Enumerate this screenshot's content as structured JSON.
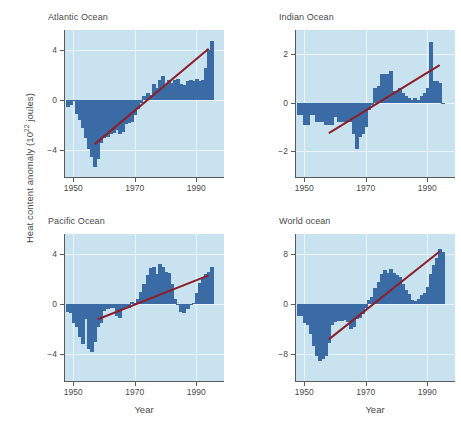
{
  "figure": {
    "ylabel_prefix": "Heat content anomaly (10",
    "ylabel_sup": "22",
    "ylabel_suffix": " joules)",
    "xlabel": "Year",
    "colors": {
      "bar": "#3a6ba5",
      "panel_background": "#c9e2f0",
      "gridline": "#eaf4fa",
      "trend_line": "#8b1f2a",
      "axis": "#5a5a5a",
      "text": "#4a4a4a",
      "page_background": "#ffffff"
    }
  },
  "chart_data": [
    {
      "type": "bar",
      "title": "Atlantic Ocean",
      "xlabel": "Year",
      "ylabel": "Heat content anomaly (10^22 joules)",
      "xlim": [
        1947,
        1999
      ],
      "ylim": [
        -6.2,
        5.6
      ],
      "xticks": [
        1950,
        1970,
        1990
      ],
      "yticks": [
        -4,
        0,
        4
      ],
      "grid": true,
      "trend_line": {
        "x": [
          1957,
          1994
        ],
        "y": [
          -3.5,
          4.1
        ]
      },
      "x": [
        1948,
        1949,
        1950,
        1951,
        1952,
        1953,
        1954,
        1955,
        1956,
        1957,
        1958,
        1959,
        1960,
        1961,
        1962,
        1963,
        1964,
        1965,
        1966,
        1967,
        1968,
        1969,
        1970,
        1971,
        1972,
        1973,
        1974,
        1975,
        1976,
        1977,
        1978,
        1979,
        1980,
        1981,
        1982,
        1983,
        1984,
        1985,
        1986,
        1987,
        1988,
        1989,
        1990,
        1991,
        1992,
        1993,
        1994,
        1995
      ],
      "values": [
        -0.5,
        -0.4,
        0.0,
        -1.1,
        -1.6,
        -2.2,
        -3.0,
        -3.9,
        -4.5,
        -5.3,
        -4.7,
        -3.4,
        -3.0,
        -2.9,
        -2.7,
        -2.6,
        -2.4,
        -2.7,
        -2.5,
        -1.9,
        -1.8,
        -1.7,
        -1.2,
        -0.7,
        -0.2,
        0.3,
        0.6,
        0.4,
        1.3,
        1.0,
        1.6,
        1.9,
        1.3,
        1.6,
        1.4,
        1.6,
        1.7,
        1.3,
        1.2,
        1.5,
        1.6,
        1.5,
        1.7,
        1.5,
        1.6,
        2.6,
        4.0,
        4.7
      ]
    },
    {
      "type": "bar",
      "title": "Indian Ocean",
      "xlabel": "Year",
      "ylabel": "Heat content anomaly (10^22 joules)",
      "xlim": [
        1947,
        1999
      ],
      "ylim": [
        -3.1,
        3.0
      ],
      "xticks": [
        1950,
        1970,
        1990
      ],
      "yticks": [
        -2,
        0,
        2
      ],
      "grid": true,
      "trend_line": {
        "x": [
          1958,
          1994
        ],
        "y": [
          -1.25,
          1.55
        ]
      },
      "x": [
        1948,
        1949,
        1950,
        1951,
        1952,
        1953,
        1954,
        1955,
        1956,
        1957,
        1958,
        1959,
        1960,
        1961,
        1962,
        1963,
        1964,
        1965,
        1966,
        1967,
        1968,
        1969,
        1970,
        1971,
        1972,
        1973,
        1974,
        1975,
        1976,
        1977,
        1978,
        1979,
        1980,
        1981,
        1982,
        1983,
        1984,
        1985,
        1986,
        1987,
        1988,
        1989,
        1990,
        1991,
        1992,
        1993,
        1994,
        1995
      ],
      "values": [
        -0.5,
        -0.5,
        -0.9,
        -0.9,
        -0.5,
        -0.5,
        -0.8,
        -0.8,
        -0.8,
        -0.9,
        -0.9,
        -0.9,
        -0.6,
        -0.8,
        -0.8,
        -0.8,
        -0.8,
        -0.8,
        -1.3,
        -1.9,
        -1.4,
        -1.3,
        -1.0,
        -0.3,
        -0.1,
        0.6,
        0.7,
        1.2,
        1.2,
        1.2,
        1.3,
        0.5,
        0.5,
        0.6,
        0.4,
        0.3,
        0.2,
        0.1,
        0.2,
        0.1,
        0.3,
        0.4,
        0.6,
        2.5,
        0.9,
        0.9,
        0.8,
        0.0
      ]
    },
    {
      "type": "bar",
      "title": "Pacific Ocean",
      "xlabel": "Year",
      "ylabel": "Heat content anomaly (10^22 joules)",
      "xlim": [
        1947,
        1999
      ],
      "ylim": [
        -6.2,
        5.6
      ],
      "xticks": [
        1950,
        1970,
        1990
      ],
      "yticks": [
        -4,
        0,
        4
      ],
      "grid": true,
      "trend_line": {
        "x": [
          1958,
          1994
        ],
        "y": [
          -1.2,
          2.3
        ]
      },
      "x": [
        1948,
        1949,
        1950,
        1951,
        1952,
        1953,
        1954,
        1955,
        1956,
        1957,
        1958,
        1959,
        1960,
        1961,
        1962,
        1963,
        1964,
        1965,
        1966,
        1967,
        1968,
        1969,
        1970,
        1971,
        1972,
        1973,
        1974,
        1975,
        1976,
        1977,
        1978,
        1979,
        1980,
        1981,
        1982,
        1983,
        1984,
        1985,
        1986,
        1987,
        1988,
        1989,
        1990,
        1991,
        1992,
        1993,
        1994,
        1995
      ],
      "values": [
        -0.6,
        -0.7,
        -1.5,
        -1.8,
        -2.6,
        -3.2,
        -1.2,
        -3.6,
        -3.8,
        -3.0,
        -1.8,
        -1.5,
        -0.5,
        -0.4,
        -0.3,
        -0.3,
        -0.9,
        -1.1,
        -0.4,
        -0.2,
        -0.3,
        0.2,
        0.1,
        0.4,
        1.0,
        1.6,
        2.3,
        2.9,
        3.0,
        2.4,
        3.2,
        3.0,
        2.6,
        2.5,
        1.6,
        0.4,
        -0.1,
        -0.6,
        -0.7,
        -0.4,
        -0.1,
        0.1,
        0.9,
        1.7,
        2.2,
        2.4,
        2.6,
        3.0
      ]
    },
    {
      "type": "bar",
      "title": "World ocean",
      "xlabel": "Year",
      "ylabel": "Heat content anomaly (10^22 joules)",
      "xlim": [
        1947,
        1999
      ],
      "ylim": [
        -12.4,
        11.2
      ],
      "xticks": [
        1950,
        1970,
        1990
      ],
      "yticks": [
        -8,
        0,
        8
      ],
      "grid": true,
      "trend_line": {
        "x": [
          1958,
          1994
        ],
        "y": [
          -5.6,
          8.4
        ]
      },
      "x": [
        1948,
        1949,
        1950,
        1951,
        1952,
        1953,
        1954,
        1955,
        1956,
        1957,
        1958,
        1959,
        1960,
        1961,
        1962,
        1963,
        1964,
        1965,
        1966,
        1967,
        1968,
        1969,
        1970,
        1971,
        1972,
        1973,
        1974,
        1975,
        1976,
        1977,
        1978,
        1979,
        1980,
        1981,
        1982,
        1983,
        1984,
        1985,
        1986,
        1987,
        1988,
        1989,
        1990,
        1991,
        1992,
        1993,
        1994,
        1995
      ],
      "values": [
        -1.8,
        -1.8,
        -3.0,
        -3.3,
        -4.8,
        -6.6,
        -8.2,
        -9.0,
        -8.8,
        -8.2,
        -6.2,
        -3.3,
        -2.8,
        -2.7,
        -2.6,
        -2.5,
        -2.9,
        -4.0,
        -3.6,
        -2.4,
        -2.2,
        -1.6,
        -0.6,
        0.6,
        1.2,
        2.6,
        3.6,
        4.8,
        5.4,
        5.0,
        5.6,
        5.0,
        4.6,
        4.4,
        3.3,
        2.3,
        1.6,
        0.6,
        0.5,
        0.9,
        1.5,
        1.8,
        2.8,
        4.8,
        6.3,
        7.4,
        8.8,
        8.3
      ]
    }
  ]
}
